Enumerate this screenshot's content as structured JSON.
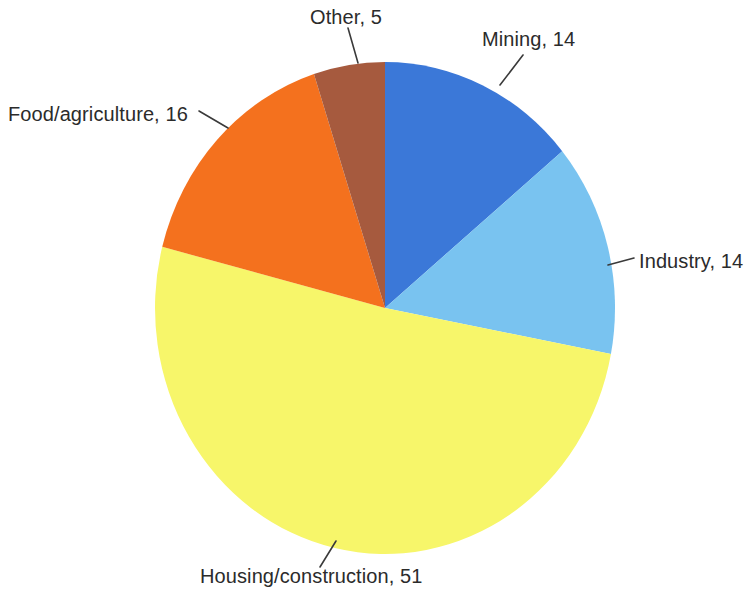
{
  "chart_data": {
    "type": "pie",
    "title": "",
    "subtitle": "",
    "xlabel": "",
    "ylabel": "",
    "grid": false,
    "legend_position": "none",
    "label_format": "name, value",
    "total": 100,
    "start_angle_deg": 0,
    "direction": "clockwise",
    "categories": [
      "Mining",
      "Industry",
      "Housing/construction",
      "Food/agriculture",
      "Other"
    ],
    "values": [
      14,
      14,
      51,
      16,
      5
    ],
    "slices": [
      {
        "name": "Mining",
        "value": 14,
        "label": "Mining, 14",
        "color": "#3b78d8",
        "color_name": "blue",
        "start_deg": 0,
        "end_deg": 50.4
      },
      {
        "name": "Industry",
        "value": 14,
        "label": "Industry, 14",
        "color": "#79c3f0",
        "color_name": "light-blue",
        "start_deg": 50.4,
        "end_deg": 100.8
      },
      {
        "name": "Housing/construction",
        "value": 51,
        "label": "Housing/construction, 51",
        "color": "#f7f66a",
        "color_name": "yellow",
        "start_deg": 100.8,
        "end_deg": 284.4
      },
      {
        "name": "Food/agriculture",
        "value": 16,
        "label": "Food/agriculture, 16",
        "color": "#f4711e",
        "color_name": "orange",
        "start_deg": 284.4,
        "end_deg": 342.0
      },
      {
        "name": "Other",
        "value": 5,
        "label": "Other, 5",
        "color": "#a65a3e",
        "color_name": "brown",
        "start_deg": 342.0,
        "end_deg": 360.0
      }
    ],
    "background_color": "#ffffff",
    "label_text_color": "#2b2b2b",
    "leader_line_color": "#3a3a3a"
  },
  "geometry": {
    "center_x": 385,
    "center_y": 308,
    "radius_x": 230,
    "radius_y": 246
  },
  "leaders": {
    "other": {
      "x1": 358,
      "y1": 63,
      "x2": 348,
      "y2": 28
    },
    "mining": {
      "x1": 500,
      "y1": 85,
      "x2": 523,
      "y2": 55
    },
    "food": {
      "x1": 228,
      "y1": 128,
      "x2": 199,
      "y2": 111
    },
    "industry": {
      "x1": 608,
      "y1": 265,
      "x2": 634,
      "y2": 258
    },
    "housing": {
      "x1": 336,
      "y1": 541,
      "x2": 320,
      "y2": 567
    }
  }
}
